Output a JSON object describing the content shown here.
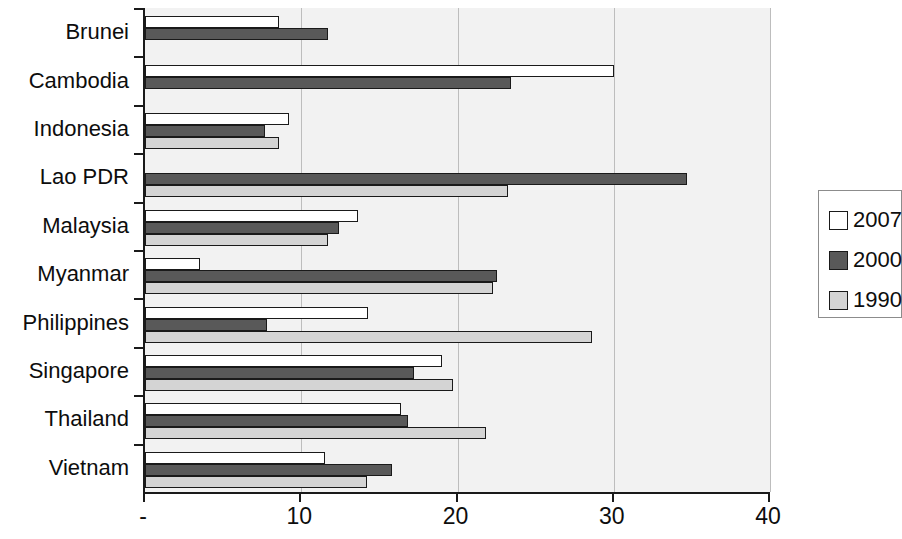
{
  "chart_data": {
    "type": "bar",
    "orientation": "horizontal",
    "title": "",
    "subtitle": "",
    "xlabel": "",
    "ylabel": "",
    "xlim": [
      0,
      40
    ],
    "ylim": null,
    "grid": true,
    "legend_position": "right",
    "xticks": [
      {
        "value": 0,
        "label": "-"
      },
      {
        "value": 10,
        "label": "10"
      },
      {
        "value": 20,
        "label": "20"
      },
      {
        "value": 30,
        "label": "30"
      },
      {
        "value": 40,
        "label": "40"
      }
    ],
    "categories": [
      "Brunei",
      "Cambodia",
      "Indonesia",
      "Lao PDR",
      "Malaysia",
      "Myanmar",
      "Philippines",
      "Singapore",
      "Thailand",
      "Vietnam"
    ],
    "series": [
      {
        "name": "2007",
        "color": "#ffffff",
        "values": [
          8.6,
          30.0,
          9.2,
          0,
          13.6,
          3.5,
          14.3,
          19.0,
          16.4,
          11.5
        ]
      },
      {
        "name": "2000",
        "color": "#595959",
        "values": [
          11.7,
          23.4,
          7.7,
          34.7,
          12.4,
          22.5,
          7.8,
          17.2,
          16.8,
          15.8
        ]
      },
      {
        "name": "1990",
        "color": "#d4d4d4",
        "values": [
          0,
          0,
          8.6,
          23.2,
          11.7,
          22.3,
          28.6,
          19.7,
          21.8,
          14.2
        ]
      }
    ]
  },
  "legend": {
    "items": [
      {
        "label": "2007",
        "swatch": "legend-swatch-2007"
      },
      {
        "label": "2000",
        "swatch": "legend-swatch-2000"
      },
      {
        "label": "1990",
        "swatch": "legend-swatch-1990"
      }
    ]
  },
  "colors": {
    "plot_background": "#f2f2f2",
    "axis": "#1a1a1a",
    "gridline": "#bdbdbd",
    "series_2007": "#ffffff",
    "series_2000": "#595959",
    "series_1990": "#d4d4d4"
  }
}
